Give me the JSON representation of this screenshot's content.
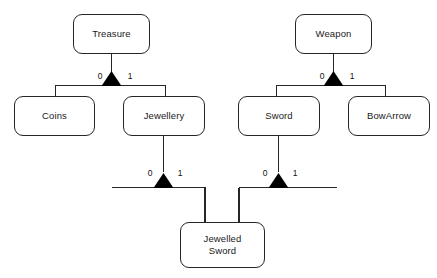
{
  "diagram": {
    "type": "uml-class-generalization-diagram",
    "background_color": "#ffffff",
    "line_color": "#262626",
    "triangle_fill": "#000000",
    "text_color": "#1a1a1a"
  },
  "classes": [
    {
      "id": "treasure",
      "label": "Treasure",
      "x": 73,
      "y": 14,
      "width": 77,
      "height": 40
    },
    {
      "id": "weapon",
      "label": "Weapon",
      "x": 295,
      "y": 14,
      "width": 77,
      "height": 40
    },
    {
      "id": "coins",
      "label": "Coins",
      "x": 14,
      "y": 96,
      "width": 81,
      "height": 40
    },
    {
      "id": "jewellery",
      "label": "Jewellery",
      "x": 123,
      "y": 96,
      "width": 82,
      "height": 40
    },
    {
      "id": "sword",
      "label": "Sword",
      "x": 238,
      "y": 96,
      "width": 82,
      "height": 40
    },
    {
      "id": "bowarrow",
      "label": "BowArrow",
      "x": 348,
      "y": 96,
      "width": 82,
      "height": 40
    },
    {
      "id": "jewelled_sword",
      "label": "Jewelled\nSword",
      "x": 180,
      "y": 222,
      "width": 85,
      "height": 46
    }
  ],
  "generalizations": [
    {
      "id": "treasure-gen",
      "parent": "Treasure",
      "children": [
        "Coins",
        "Jewellery"
      ],
      "left_multiplicity": "0",
      "right_multiplicity": "1"
    },
    {
      "id": "weapon-gen",
      "parent": "Weapon",
      "children": [
        "Sword",
        "BowArrow"
      ],
      "left_multiplicity": "0",
      "right_multiplicity": "1"
    },
    {
      "id": "jewellery-gen",
      "parent": "Jewellery",
      "children": [
        "Jewelled Sword"
      ],
      "left_multiplicity": "0",
      "right_multiplicity": "1"
    },
    {
      "id": "sword-gen",
      "parent": "Sword",
      "children": [
        "Jewelled Sword"
      ],
      "left_multiplicity": "0",
      "right_multiplicity": "1"
    }
  ],
  "multiplicity_labels": [
    {
      "id": "treasure-left",
      "value": "0",
      "x": 95,
      "y": 72
    },
    {
      "id": "treasure-right",
      "value": "1",
      "x": 125,
      "y": 72
    },
    {
      "id": "weapon-left",
      "value": "0",
      "x": 317,
      "y": 72
    },
    {
      "id": "weapon-right",
      "value": "1",
      "x": 347,
      "y": 72
    },
    {
      "id": "jewellery-left",
      "value": "0",
      "x": 145,
      "y": 169
    },
    {
      "id": "jewellery-right",
      "value": "1",
      "x": 175,
      "y": 169
    },
    {
      "id": "sword-left",
      "value": "0",
      "x": 260,
      "y": 169
    },
    {
      "id": "sword-right",
      "value": "1",
      "x": 290,
      "y": 169
    }
  ]
}
